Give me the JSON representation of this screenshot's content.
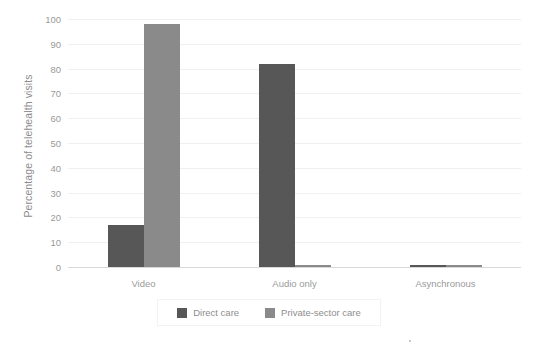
{
  "chart_data": {
    "type": "bar",
    "title": "",
    "xlabel": "",
    "ylabel": "Percentage of telehealth visits",
    "ylim": [
      0,
      100
    ],
    "yticks": [
      0,
      10,
      20,
      30,
      40,
      50,
      60,
      70,
      80,
      90,
      100
    ],
    "grid": true,
    "legend_position": "bottom",
    "categories": [
      "Video",
      "Audio only",
      "Asynchronous"
    ],
    "series": [
      {
        "name": "Direct care",
        "color": "#575757",
        "values": [
          17,
          82,
          1
        ]
      },
      {
        "name": "Private-sector care",
        "color": "#8a8a8a",
        "values": [
          98,
          1,
          1
        ]
      }
    ]
  },
  "axis": {
    "y_title": "Percentage of telehealth visits"
  }
}
